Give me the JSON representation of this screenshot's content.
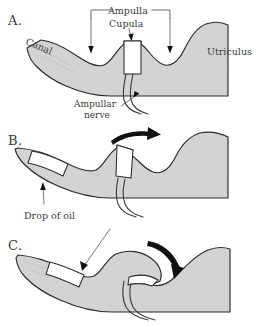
{
  "figure": {
    "background_color": "#ffffff",
    "ink_color": "#2b2b2b",
    "tissue_fill": "#d3d3d3",
    "arrow_color": "#111111"
  },
  "panels": [
    {
      "id": "A",
      "letter": "A.",
      "labels": {
        "canal": "Canal",
        "ampulla": "Ampulla",
        "cupula": "Cupula",
        "utriculus": "Utriculus",
        "ampullar_nerve_line1": "Ampullar",
        "ampullar_nerve_line2": "nerve"
      }
    },
    {
      "id": "B",
      "letter": "B.",
      "labels": {
        "drop_of_oil": "Drop of oil"
      },
      "arrow": {
        "name": "rotation-arrow-right",
        "direction": "right"
      }
    },
    {
      "id": "C",
      "letter": "C.",
      "labels": {},
      "arrow": {
        "name": "rotation-arrow-down-right",
        "direction": "down-right"
      }
    }
  ],
  "annotations": {
    "ampulla_bracket": "Ampulla",
    "cupula_pointer": "Cupula",
    "nerve_pointer": "Ampullar nerve",
    "oil_pointer": "Drop of oil"
  }
}
